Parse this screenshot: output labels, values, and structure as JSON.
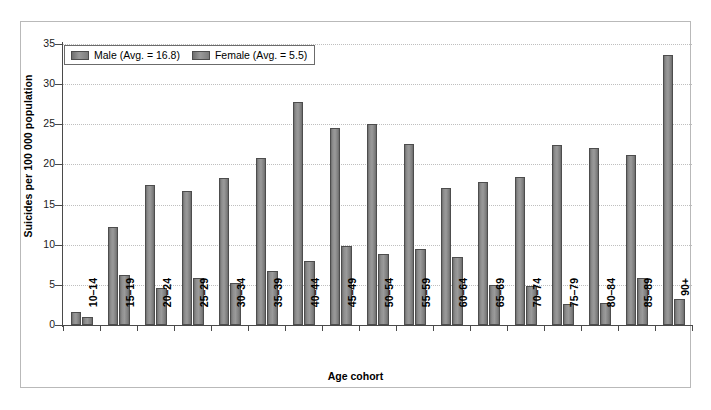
{
  "chart_data": {
    "type": "bar",
    "title": "",
    "xlabel": "Age cohort",
    "ylabel": "Suicides per 100 000 population",
    "ylim": [
      0,
      35
    ],
    "ytick_step": 5,
    "yticks": [
      "0",
      "5",
      "10",
      "15",
      "20",
      "25",
      "30",
      "35"
    ],
    "grid": true,
    "legend_position": "top-left",
    "categories": [
      "10–14",
      "15–19",
      "20–24",
      "25–29",
      "30–34",
      "35–39",
      "40–44",
      "45–49",
      "50–54",
      "55–59",
      "60–64",
      "65–69",
      "70–74",
      "75–79",
      "80–84",
      "85–89",
      "90+"
    ],
    "series": [
      {
        "name": "Male",
        "legend_label": "Male (Avg. = 16.8)",
        "average": 16.8,
        "color": "#8e8e8e",
        "values": [
          1.6,
          12.2,
          17.5,
          16.7,
          18.3,
          20.8,
          27.8,
          24.6,
          25.0,
          22.5,
          17.1,
          17.8,
          18.4,
          22.4,
          22.1,
          21.2,
          33.6
        ]
      },
      {
        "name": "Female",
        "legend_label": "Female (Avg. = 5.5)",
        "average": 5.5,
        "color": "#8e8e8e",
        "values": [
          1.0,
          6.2,
          4.6,
          5.8,
          5.2,
          6.7,
          8.0,
          9.9,
          8.8,
          9.5,
          8.5,
          5.0,
          4.8,
          2.6,
          2.8,
          5.9,
          3.2
        ]
      }
    ]
  },
  "legend": {
    "items": [
      {
        "label": "Male (Avg. = 16.8)"
      },
      {
        "label": "Female (Avg. = 5.5)"
      }
    ]
  },
  "axes": {
    "y_title": "Suicides per 100 000 population",
    "x_title": "Age cohort"
  }
}
